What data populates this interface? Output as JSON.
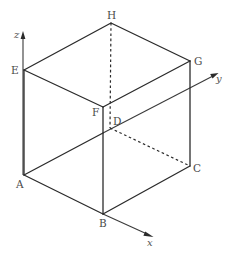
{
  "diagram": {
    "type": "cube-with-3d-axes",
    "vertices": {
      "A": {
        "label": "A",
        "x": 24,
        "y": 175
      },
      "B": {
        "label": "B",
        "x": 103,
        "y": 214
      },
      "C": {
        "label": "C",
        "x": 190,
        "y": 166
      },
      "D": {
        "label": "D",
        "x": 110,
        "y": 128
      },
      "E": {
        "label": "E",
        "x": 24,
        "y": 70
      },
      "F": {
        "label": "F",
        "x": 103,
        "y": 107
      },
      "G": {
        "label": "G",
        "x": 190,
        "y": 61
      },
      "H": {
        "label": "H",
        "x": 111,
        "y": 23
      }
    },
    "visible_edges": [
      "AB",
      "BC",
      "CG",
      "GH",
      "HE",
      "EA",
      "EF",
      "FG",
      "FB"
    ],
    "hidden_edges": [
      "HD",
      "DC",
      "DA"
    ],
    "axes": {
      "x": {
        "label": "x",
        "from": "B",
        "tip": [
          153,
          237
        ]
      },
      "y": {
        "label": "y",
        "from": "D",
        "tip": [
          218,
          73
        ]
      },
      "z": {
        "label": "z",
        "from": "A",
        "tip": [
          23,
          32
        ]
      }
    },
    "colors": {
      "line": "#2b2b2b",
      "label": "#4a4a4a",
      "background": "#ffffff"
    }
  }
}
